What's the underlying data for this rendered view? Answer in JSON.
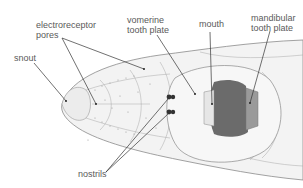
{
  "diagram": {
    "labels": {
      "electroreceptor_pores": "electroreceptor\npores",
      "vomerine_tooth_plate": "vomerine\ntooth plate",
      "mouth": "mouth",
      "mandibular_tooth_plate": "mandibular\ntooth plate",
      "snout": "snout",
      "nostrils": "nostrils"
    },
    "colors": {
      "background": "#ffffff",
      "outline": "#8a8a8a",
      "skin": "#f2f2f2",
      "mouth_dark": "#6b6b6b",
      "tooth_plate": "#9a9a9a",
      "leader": "#333333",
      "text": "#5a5a5a"
    }
  }
}
